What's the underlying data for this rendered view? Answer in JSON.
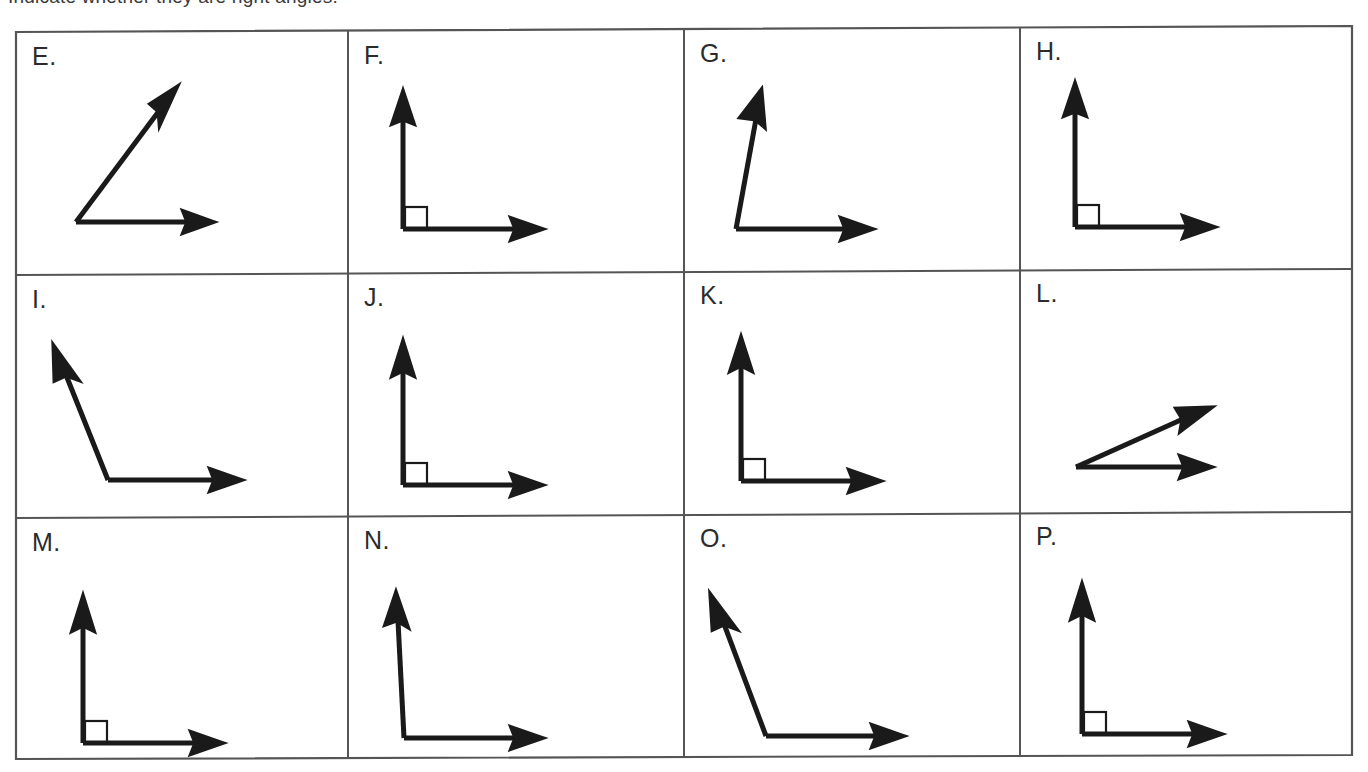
{
  "page": {
    "instruction": "Indicate whether they are right angles.",
    "background_color": "#ffffff",
    "ink_color": "#1a1a1a",
    "border_color": "#555555"
  },
  "grid": {
    "rows": 3,
    "columns": 4,
    "cell_width": 335,
    "cell_height": 245
  },
  "cells": [
    {
      "label": "E.",
      "angle_type": "acute",
      "right_angle_mark": false,
      "vertex": [
        60,
        190
      ],
      "ray1": [
        180,
        190
      ],
      "ray2": [
        150,
        70
      ],
      "description": "acute angle opening right and up"
    },
    {
      "label": "F.",
      "angle_type": "right",
      "right_angle_mark": true,
      "vertex": [
        55,
        190
      ],
      "ray1": [
        190,
        190
      ],
      "ray2": [
        55,
        55
      ],
      "description": "right angle with square mark"
    },
    {
      "label": "G.",
      "angle_type": "obtuse",
      "right_angle_mark": false,
      "vertex": [
        52,
        192
      ],
      "ray1": [
        185,
        192
      ],
      "ray2": [
        68,
        58
      ],
      "description": "angle slightly greater than ninety degrees, no square mark"
    },
    {
      "label": "H.",
      "angle_type": "right",
      "right_angle_mark": true,
      "vertex": [
        55,
        190
      ],
      "ray1": [
        190,
        190
      ],
      "ray2": [
        55,
        52
      ],
      "description": "right angle with square mark"
    },
    {
      "label": "I.",
      "angle_type": "obtuse",
      "right_angle_mark": false,
      "vertex": [
        92,
        190
      ],
      "ray1": [
        218,
        190
      ],
      "ray2": [
        38,
        78
      ],
      "description": "obtuse angle with ray up and to the left"
    },
    {
      "label": "J.",
      "angle_type": "right",
      "right_angle_mark": true,
      "vertex": [
        55,
        195
      ],
      "ray1": [
        185,
        195
      ],
      "ray2": [
        55,
        65
      ],
      "description": "right angle with square mark"
    },
    {
      "label": "K.",
      "angle_type": "right",
      "right_angle_mark": true,
      "vertex": [
        57,
        196
      ],
      "ray1": [
        186,
        196
      ],
      "ray2": [
        57,
        64
      ],
      "description": "right angle with square mark"
    },
    {
      "label": "L.",
      "angle_type": "acute",
      "right_angle_mark": false,
      "vertex": [
        56,
        192
      ],
      "ray1": [
        185,
        192
      ],
      "ray2": [
        188,
        136
      ],
      "description": "narrow acute angle formed by two nearly horizontal rays"
    },
    {
      "label": "M.",
      "angle_type": "right",
      "right_angle_mark": true,
      "vertex": [
        65,
        212
      ],
      "ray1": [
        192,
        212
      ],
      "ray2": [
        65,
        85
      ],
      "description": "right angle with square mark"
    },
    {
      "label": "N.",
      "angle_type": "obtuse",
      "right_angle_mark": false,
      "vertex": [
        55,
        212
      ],
      "ray1": [
        180,
        212
      ],
      "ray2": [
        48,
        82
      ],
      "description": "angle slightly greater than ninety degrees, no square mark"
    },
    {
      "label": "O.",
      "angle_type": "obtuse",
      "right_angle_mark": false,
      "vertex": [
        82,
        210
      ],
      "ray1": [
        210,
        210
      ],
      "ray2": [
        28,
        88
      ],
      "description": "obtuse angle with ray up and to the left"
    },
    {
      "label": "P.",
      "angle_type": "right",
      "right_angle_mark": true,
      "vertex": [
        62,
        212
      ],
      "ray1": [
        192,
        212
      ],
      "ray2": [
        62,
        80
      ],
      "description": "right angle with square mark"
    }
  ],
  "figure_style": {
    "stroke_width": 5,
    "arrow_head_length": 22,
    "arrow_head_width": 16,
    "right_angle_box_size": 22,
    "right_angle_box_stroke": 2
  }
}
